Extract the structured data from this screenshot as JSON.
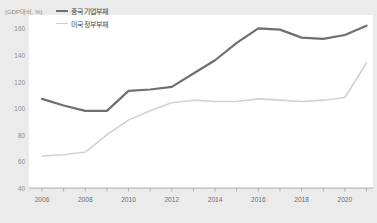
{
  "chart_data": {
    "type": "line",
    "title": "",
    "xlabel": "",
    "ylabel": "(GDP대비, %)",
    "ylim": [
      40,
      170
    ],
    "yticks": [
      40,
      60,
      80,
      100,
      120,
      140,
      160
    ],
    "xlim": [
      2005.4,
      2021.3
    ],
    "xticks": [
      2006,
      2007,
      2008,
      2009,
      2010,
      2011,
      2012,
      2013,
      2014,
      2015,
      2016,
      2017,
      2018,
      2019,
      2020,
      2021
    ],
    "xtick_labels_shown": [
      "2006",
      "2008",
      "2010",
      "2012",
      "2014",
      "2016",
      "2018",
      "2020"
    ],
    "grid": false,
    "legend_position": "top-left",
    "x": [
      2006,
      2007,
      2008,
      2009,
      2010,
      2011,
      2012,
      2013,
      2014,
      2015,
      2016,
      2017,
      2018,
      2019,
      2020,
      2021
    ],
    "series": [
      {
        "name": "중국 기업부채",
        "color": "#6f6f6f",
        "line_width": 2.2,
        "values": [
          107,
          102,
          98,
          98,
          113,
          114,
          116,
          126,
          136,
          149,
          160,
          159,
          153,
          152,
          155,
          162
        ]
      },
      {
        "name": "미국 정부부채",
        "color": "#d2d2d2",
        "line_width": 1.6,
        "values": [
          64,
          65,
          67,
          80,
          91,
          98,
          104,
          106,
          105,
          105,
          107,
          106,
          105,
          106,
          108,
          134
        ]
      }
    ]
  },
  "axes": {
    "unit_label": "(GDP대비, %)",
    "y_tick_labels": [
      "160",
      "140",
      "120",
      "100",
      "80",
      "60",
      "40"
    ],
    "x_tick_labels": [
      "2006",
      "2008",
      "2010",
      "2012",
      "2014",
      "2016",
      "2018",
      "2020"
    ]
  },
  "legend": {
    "entries": [
      {
        "label": "중국 기업부채"
      },
      {
        "label": "미국 정부부채"
      }
    ]
  },
  "colors": {
    "series_china": "#6f6f6f",
    "series_us": "#d2d2d2",
    "plot_background": "#ffffff",
    "page_background": "#ebebeb",
    "axis_text": "#8d8d8d"
  }
}
